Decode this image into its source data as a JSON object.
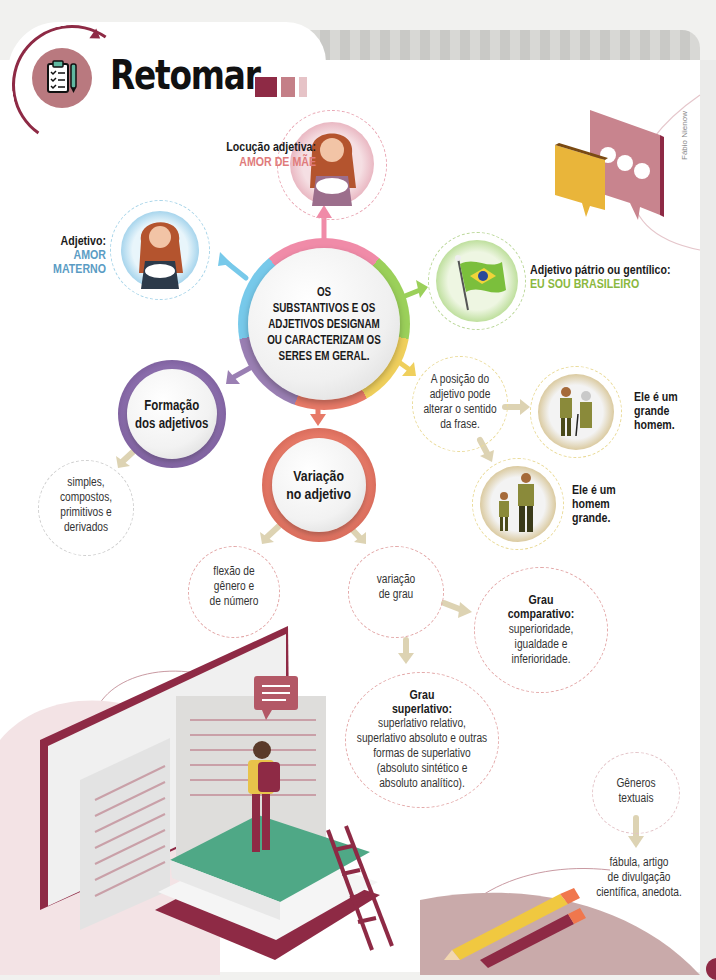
{
  "header": {
    "title": "Retomar",
    "icon": "clipboard-checklist-icon",
    "blocks": [
      "#8e2a45",
      "#c47f87",
      "#e6c3c7"
    ]
  },
  "credit": "Fábio Nienow",
  "hub": {
    "text": "OS\nSUBSTANTIVOS E OS\nADJETIVOS DESIGNAM\nOU CARACTERIZAM OS\nSERES EM GERAL."
  },
  "branches": {
    "locucao": {
      "label": "Locução adjetiva:",
      "example": "AMOR DE MÃE",
      "color": "#e07b7b"
    },
    "adjetivo": {
      "label": "Adjetivo:",
      "example": "AMOR\nMATERNO",
      "color": "#5a9cc4"
    },
    "patrio": {
      "label": "Adjetivo pátrio ou gentílico:",
      "example": "EU SOU BRASILEIRO",
      "color": "#8ab840"
    },
    "posicao": {
      "text": "A posição do\nadjetivo pode\nalterar o sentido\nda frase.",
      "example1": "Ele é um\ngrande\nhomem.",
      "example2": "Ele é um\nhomem\ngrande."
    },
    "formacao": {
      "title": "Formação\ndos adjetivos",
      "detail": "simples,\ncompostos,\nprimitivos e\nderivados"
    },
    "variacao": {
      "title": "Variação\nno adjetivo",
      "flexao": "flexão de\ngênero e\nde número",
      "grau": "variação\nde grau",
      "comparativo_title": "Grau\ncomparativo:",
      "comparativo_text": "superioridade,\nigualdade e\ninferioridade.",
      "superlativo_title": "Grau\nsuperlativo:",
      "superlativo_text": "superlativo relativo,\nsuperlativo absoluto e outras\nformas de superlativo\n(absoluto sintético e\nabsoluto analítico)."
    },
    "generos": {
      "title": "Gêneros\ntextuais",
      "detail": "fábula, artigo\nde divulgação\ncientífica, anedota."
    }
  },
  "colors": {
    "brand": "#8e2a45",
    "pink": "#f08ba8",
    "blue": "#77c9ea",
    "green": "#9bd05a",
    "yellow": "#efcf5c",
    "coral": "#e77a68",
    "purple": "#9a7fb3",
    "gold": "#c9a23a",
    "beige_arrow": "#ddd3b3"
  }
}
